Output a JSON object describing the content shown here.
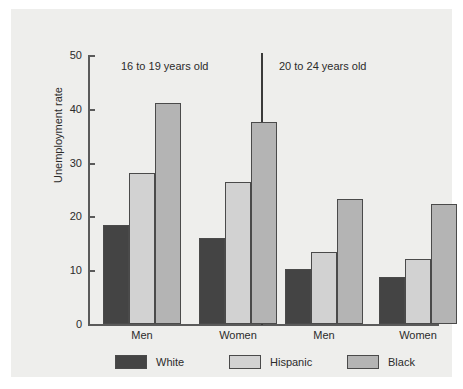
{
  "chart_data": {
    "type": "bar",
    "title": "",
    "xlabel": "",
    "ylabel": "Unemployment rate",
    "ylim": [
      0,
      50
    ],
    "yticks": [
      0,
      10,
      20,
      30,
      40,
      50
    ],
    "grid": false,
    "legend_position": "bottom",
    "panels": [
      {
        "title": "16 to 19 years old",
        "categories": [
          "Men",
          "Women"
        ],
        "series": [
          {
            "name": "White",
            "values": [
              18.5,
              16.0
            ]
          },
          {
            "name": "Hispanic",
            "values": [
              28.2,
              26.5
            ]
          },
          {
            "name": "Black",
            "values": [
              41.3,
              37.7
            ]
          }
        ]
      },
      {
        "title": "20 to 24 years old",
        "categories": [
          "Men",
          "Women"
        ],
        "series": [
          {
            "name": "White",
            "values": [
              10.2,
              8.7
            ]
          },
          {
            "name": "Hispanic",
            "values": [
              13.4,
              12.2
            ]
          },
          {
            "name": "Black",
            "values": [
              23.4,
              22.4
            ]
          }
        ]
      }
    ],
    "colors": {
      "White": "#444444",
      "Hispanic": "#d2d2d2",
      "Black": "#b4b4b4",
      "background": "#eeeeec",
      "axis": "#5a5a5a"
    }
  },
  "legend": {
    "items": [
      {
        "label": "White"
      },
      {
        "label": "Hispanic"
      },
      {
        "label": "Black"
      }
    ]
  },
  "axis": {
    "tick_labels": [
      "50",
      "40",
      "30",
      "20",
      "10",
      "0"
    ],
    "y_title": "Unemployment rate"
  },
  "panel_titles": [
    "16 to 19 years old",
    "20 to 24 years old"
  ],
  "group_labels": [
    "Men",
    "Women",
    "Men",
    "Women"
  ]
}
